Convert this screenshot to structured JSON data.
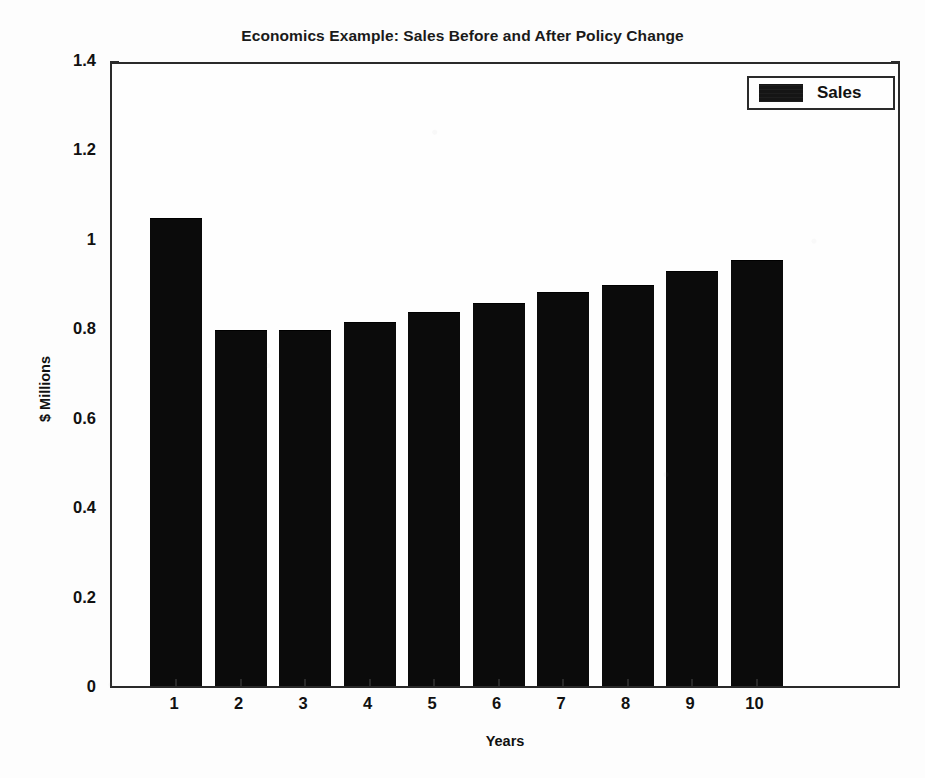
{
  "chart_data": {
    "type": "bar",
    "title": "Economics Example: Sales Before and After Policy Change",
    "xlabel": "Years",
    "ylabel": "$ Millions",
    "categories": [
      "1",
      "2",
      "3",
      "4",
      "5",
      "6",
      "7",
      "8",
      "9",
      "10"
    ],
    "values": [
      1.045,
      0.794,
      0.794,
      0.812,
      0.834,
      0.854,
      0.879,
      0.895,
      0.926,
      0.951
    ],
    "series": [
      {
        "name": "Sales",
        "color": "#0b0b0b",
        "values": [
          1.045,
          0.794,
          0.794,
          0.812,
          0.834,
          0.854,
          0.879,
          0.895,
          0.926,
          0.951
        ]
      }
    ],
    "ylim": [
      0,
      1.4
    ],
    "yticks": [
      "0",
      "0.2",
      "0.4",
      "0.6",
      "0.8",
      "1",
      "1.2",
      "1.4"
    ],
    "ytick_values": [
      0,
      0.2,
      0.4,
      0.6,
      0.8,
      1,
      1.2,
      1.4
    ],
    "grid": false,
    "legend": {
      "position": "top-right",
      "entries": [
        {
          "label": "Sales",
          "color": "#0b0b0b",
          "swatch": "filled-rect-swatch"
        }
      ]
    },
    "axis_color": "#2a2a2a",
    "background": "#fdfdfd"
  },
  "figure": {
    "caption_fragment": ""
  }
}
